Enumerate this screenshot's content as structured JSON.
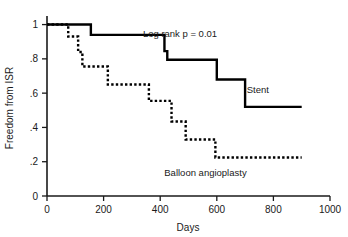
{
  "chart_data": {
    "type": "line",
    "title": "",
    "xlabel": "Days",
    "ylabel": "Freedom from ISR",
    "xlim": [
      0,
      1000
    ],
    "ylim": [
      0,
      1.05
    ],
    "grid": false,
    "legend_position": "inline-annotation",
    "xticks": [
      0,
      200,
      400,
      600,
      800,
      1000
    ],
    "xtick_labels": [
      "0",
      "200",
      "400",
      "600",
      "800",
      "1000"
    ],
    "yticks": [
      0,
      0.2,
      0.4,
      0.6,
      0.8,
      1.0
    ],
    "ytick_labels": [
      "0",
      ".2",
      ".4",
      ".6",
      ".8",
      "1"
    ],
    "annotations": [
      {
        "name": "log-rank-annotation",
        "text": "Log rank p = 0.01",
        "x": 470,
        "y": 0.93
      },
      {
        "name": "stent-series-label",
        "text": "Stent",
        "x": 745,
        "y": 0.6
      },
      {
        "name": "balloon-series-label",
        "text": "Balloon angioplasty",
        "x": 560,
        "y": 0.115
      }
    ],
    "series": [
      {
        "name": "Stent",
        "style": "solid",
        "color": "#000000",
        "width": 2.4,
        "step": "post",
        "x": [
          0,
          155,
          415,
          425,
          600,
          700,
          900
        ],
        "values": [
          1.0,
          0.94,
          0.845,
          0.795,
          0.68,
          0.52,
          0.52
        ]
      },
      {
        "name": "Balloon angioplasty",
        "style": "dotted",
        "color": "#000000",
        "width": 2.4,
        "step": "post",
        "x": [
          0,
          75,
          110,
          125,
          215,
          360,
          440,
          490,
          595,
          900
        ],
        "values": [
          1.0,
          0.93,
          0.84,
          0.755,
          0.65,
          0.555,
          0.435,
          0.33,
          0.225,
          0.225
        ]
      }
    ]
  }
}
